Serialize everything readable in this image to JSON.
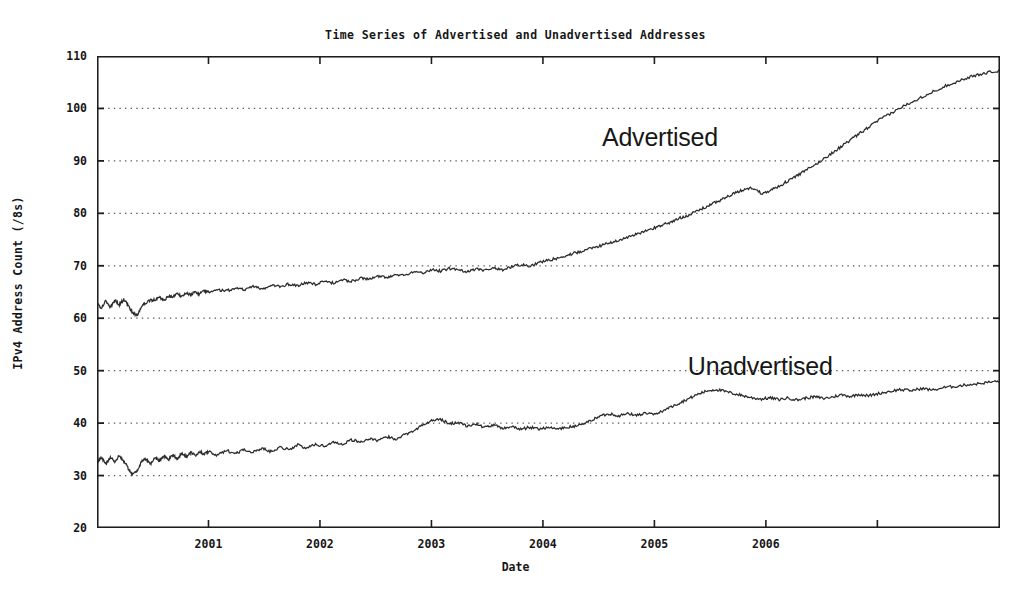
{
  "chart_data": {
    "type": "line",
    "title": "Time Series of Advertised and Unadvertised Addresses",
    "xlabel": "Date",
    "ylabel": "IPv4 Address Count (/8s)",
    "xlim": [
      2000.0,
      2008.1
    ],
    "ylim": [
      20,
      110
    ],
    "grid": true,
    "grid_style": "dotted-horizontal",
    "legend_position": "inline-annotation",
    "xticks": [
      2000,
      2001,
      2002,
      2003,
      2004,
      2005,
      2006
    ],
    "xtick_labels": [
      "2000",
      "2001",
      "2002",
      "2003",
      "2004",
      "2005",
      "2006"
    ],
    "yticks": [
      20,
      30,
      40,
      50,
      60,
      70,
      80,
      90,
      100,
      110
    ],
    "ytick_labels": [
      "20",
      "30",
      "40",
      "50",
      "60",
      "70",
      "80",
      "90",
      "100",
      "110"
    ],
    "line_color": "#2b2b2b",
    "series": [
      {
        "name": "Advertised",
        "annotation_x": 2005.05,
        "annotation_y": 94.5,
        "x": [
          2000.0,
          2000.04,
          2000.08,
          2000.12,
          2000.16,
          2000.2,
          2000.24,
          2000.28,
          2000.32,
          2000.36,
          2000.4,
          2000.44,
          2000.48,
          2000.52,
          2000.56,
          2000.6,
          2000.64,
          2000.68,
          2000.72,
          2000.76,
          2000.8,
          2000.84,
          2000.88,
          2000.92,
          2000.96,
          2001.0,
          2001.08,
          2001.16,
          2001.24,
          2001.32,
          2001.4,
          2001.48,
          2001.56,
          2001.64,
          2001.72,
          2001.8,
          2001.88,
          2001.96,
          2002.04,
          2002.12,
          2002.2,
          2002.28,
          2002.36,
          2002.44,
          2002.52,
          2002.6,
          2002.68,
          2002.76,
          2002.84,
          2002.92,
          2003.0,
          2003.08,
          2003.16,
          2003.24,
          2003.32,
          2003.4,
          2003.48,
          2003.56,
          2003.64,
          2003.72,
          2003.8,
          2003.88,
          2003.96,
          2004.04,
          2004.12,
          2004.2,
          2004.28,
          2004.36,
          2004.44,
          2004.52,
          2004.6,
          2004.68,
          2004.76,
          2004.84,
          2004.92,
          2005.0,
          2005.08,
          2005.16,
          2005.24,
          2005.32,
          2005.4,
          2005.48,
          2005.56,
          2005.64,
          2005.72,
          2005.8,
          2005.88,
          2005.96,
          2006.04,
          2006.12,
          2006.2,
          2006.28,
          2006.36,
          2006.44,
          2006.52,
          2006.6,
          2006.68,
          2006.76,
          2006.84,
          2006.92,
          2007.0,
          2007.1,
          2007.2,
          2007.3,
          2007.4,
          2007.5,
          2007.6,
          2007.7,
          2007.8,
          2007.9,
          2008.0,
          2008.1
        ],
        "y": [
          62.8,
          62.0,
          63.3,
          62.1,
          63.4,
          62.6,
          63.6,
          62.4,
          61.0,
          60.6,
          62.3,
          63.0,
          63.4,
          63.5,
          64.0,
          63.4,
          64.2,
          64.0,
          64.6,
          64.2,
          64.8,
          64.4,
          65.0,
          64.6,
          65.2,
          65.0,
          65.4,
          65.2,
          65.8,
          65.4,
          66.0,
          65.6,
          66.2,
          66.0,
          66.5,
          66.2,
          66.8,
          66.5,
          67.0,
          66.7,
          67.3,
          67.0,
          67.6,
          67.4,
          68.0,
          67.8,
          68.4,
          68.2,
          68.9,
          68.6,
          69.3,
          69.0,
          69.5,
          69.2,
          68.9,
          69.4,
          69.1,
          69.6,
          69.2,
          69.8,
          70.2,
          70.0,
          70.6,
          71.0,
          71.4,
          71.8,
          72.4,
          72.8,
          73.4,
          73.8,
          74.4,
          74.9,
          75.4,
          76.0,
          76.6,
          77.2,
          77.9,
          78.4,
          79.2,
          79.8,
          80.6,
          81.4,
          82.2,
          83.0,
          83.8,
          84.5,
          84.9,
          83.8,
          84.4,
          85.2,
          86.2,
          87.2,
          88.2,
          89.2,
          90.4,
          91.6,
          92.8,
          94.0,
          95.2,
          96.4,
          97.6,
          98.8,
          100.0,
          101.2,
          102.2,
          103.2,
          104.2,
          105.0,
          105.8,
          106.4,
          106.9,
          107.2
        ]
      },
      {
        "name": "Unadvertised",
        "annotation_x": 2005.95,
        "annotation_y": 50.8,
        "x": [
          2000.0,
          2000.04,
          2000.08,
          2000.12,
          2000.16,
          2000.2,
          2000.24,
          2000.28,
          2000.32,
          2000.36,
          2000.4,
          2000.44,
          2000.48,
          2000.52,
          2000.56,
          2000.6,
          2000.64,
          2000.68,
          2000.72,
          2000.76,
          2000.8,
          2000.84,
          2000.88,
          2000.92,
          2000.96,
          2001.0,
          2001.08,
          2001.16,
          2001.24,
          2001.32,
          2001.4,
          2001.48,
          2001.56,
          2001.64,
          2001.72,
          2001.8,
          2001.88,
          2001.96,
          2002.04,
          2002.12,
          2002.2,
          2002.28,
          2002.36,
          2002.44,
          2002.52,
          2002.6,
          2002.68,
          2002.76,
          2002.84,
          2002.92,
          2003.0,
          2003.08,
          2003.16,
          2003.24,
          2003.32,
          2003.4,
          2003.48,
          2003.56,
          2003.64,
          2003.72,
          2003.8,
          2003.88,
          2003.96,
          2004.04,
          2004.12,
          2004.2,
          2004.28,
          2004.36,
          2004.44,
          2004.52,
          2004.6,
          2004.68,
          2004.76,
          2004.84,
          2004.92,
          2005.0,
          2005.08,
          2005.16,
          2005.24,
          2005.32,
          2005.4,
          2005.48,
          2005.56,
          2005.64,
          2005.72,
          2005.8,
          2005.88,
          2005.96,
          2006.04,
          2006.12,
          2006.2,
          2006.28,
          2006.36,
          2006.44,
          2006.52,
          2006.6,
          2006.68,
          2006.76,
          2006.84,
          2006.92,
          2007.0,
          2007.1,
          2007.2,
          2007.3,
          2007.4,
          2007.5,
          2007.6,
          2007.7,
          2007.8,
          2007.9,
          2008.0,
          2008.1
        ],
        "y": [
          32.4,
          33.4,
          32.2,
          33.6,
          32.6,
          33.8,
          32.8,
          31.4,
          30.2,
          31.0,
          32.6,
          33.2,
          32.2,
          33.4,
          32.8,
          33.8,
          33.0,
          34.0,
          33.2,
          34.2,
          33.6,
          34.4,
          33.8,
          34.6,
          34.0,
          34.6,
          33.8,
          34.8,
          34.2,
          35.0,
          34.4,
          35.2,
          34.6,
          35.4,
          35.0,
          35.8,
          35.2,
          36.0,
          35.6,
          36.4,
          36.0,
          36.8,
          36.4,
          37.0,
          36.6,
          37.4,
          37.0,
          37.8,
          38.6,
          39.6,
          40.4,
          40.8,
          39.8,
          40.2,
          39.4,
          39.8,
          39.2,
          39.6,
          39.0,
          39.4,
          38.8,
          39.2,
          38.9,
          39.2,
          38.9,
          39.1,
          39.4,
          39.8,
          40.6,
          41.4,
          41.8,
          41.4,
          41.8,
          41.5,
          41.9,
          41.6,
          42.4,
          43.2,
          44.0,
          44.8,
          45.6,
          46.2,
          46.4,
          46.0,
          45.6,
          45.2,
          44.8,
          44.6,
          44.8,
          44.5,
          44.8,
          44.4,
          44.8,
          45.0,
          44.7,
          45.0,
          45.4,
          45.1,
          45.5,
          45.2,
          45.6,
          46.0,
          46.4,
          46.2,
          46.6,
          46.3,
          46.8,
          47.0,
          47.3,
          47.5,
          47.8,
          48.0
        ]
      }
    ]
  },
  "annotations": {
    "advertised_label": "Advertised",
    "unadvertised_label": "Unadvertised"
  }
}
